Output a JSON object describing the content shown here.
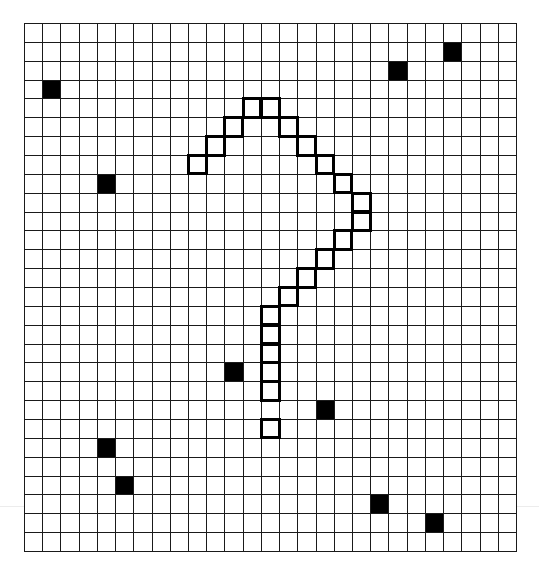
{
  "puzzle": {
    "columns": 27,
    "rows": 28,
    "colors": {
      "background": "#ffffff",
      "grid_line": "#1a1a1a",
      "filled": "#000000",
      "outline": "#000000"
    },
    "filled_cells": [
      {
        "col": 23,
        "row": 1
      },
      {
        "col": 20,
        "row": 2
      },
      {
        "col": 1,
        "row": 3
      },
      {
        "col": 4,
        "row": 8
      },
      {
        "col": 11,
        "row": 18
      },
      {
        "col": 16,
        "row": 20
      },
      {
        "col": 4,
        "row": 22
      },
      {
        "col": 5,
        "row": 24
      },
      {
        "col": 19,
        "row": 25
      },
      {
        "col": 22,
        "row": 26
      }
    ],
    "outlined_cells": [
      {
        "col": 12,
        "row": 4
      },
      {
        "col": 13,
        "row": 4
      },
      {
        "col": 11,
        "row": 5
      },
      {
        "col": 14,
        "row": 5
      },
      {
        "col": 10,
        "row": 6
      },
      {
        "col": 15,
        "row": 6
      },
      {
        "col": 9,
        "row": 7
      },
      {
        "col": 16,
        "row": 7
      },
      {
        "col": 17,
        "row": 8
      },
      {
        "col": 18,
        "row": 9
      },
      {
        "col": 18,
        "row": 10
      },
      {
        "col": 17,
        "row": 11
      },
      {
        "col": 16,
        "row": 12
      },
      {
        "col": 15,
        "row": 13
      },
      {
        "col": 14,
        "row": 14
      },
      {
        "col": 13,
        "row": 15
      },
      {
        "col": 13,
        "row": 16
      },
      {
        "col": 13,
        "row": 17
      },
      {
        "col": 13,
        "row": 18
      },
      {
        "col": 13,
        "row": 19
      },
      {
        "col": 13,
        "row": 21
      }
    ],
    "outlined_shape": "question-mark"
  }
}
